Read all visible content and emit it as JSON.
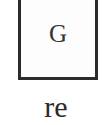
{
  "diagram": {
    "box": {
      "label": "G",
      "border_color": "#2b2b2b"
    },
    "caption": "re"
  }
}
